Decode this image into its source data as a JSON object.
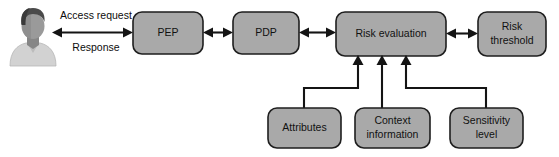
{
  "diagram": {
    "background_color": "#ffffff",
    "node_fill_color": "#a9a9a9",
    "node_border_color": "#1e1e1e",
    "connector_color": "#141414",
    "text_color": "#111111"
  },
  "actor": {
    "name": "user-avatar",
    "icon": "user-person-icon"
  },
  "edge_labels": {
    "access_request": "Access request",
    "response": "Response"
  },
  "nodes": {
    "pep": {
      "label": "PEP",
      "lines": [
        "PEP"
      ]
    },
    "pdp": {
      "label": "PDP",
      "lines": [
        "PDP"
      ]
    },
    "risk_evaluation": {
      "label": "Risk evaluation",
      "lines": [
        "Risk evaluation"
      ]
    },
    "risk_threshold": {
      "label": "Risk threshold",
      "lines": [
        "Risk",
        "threshold"
      ]
    },
    "attributes": {
      "label": "Attributes",
      "lines": [
        "Attributes"
      ]
    },
    "context_information": {
      "label": "Context information",
      "lines": [
        "Context",
        "information"
      ]
    },
    "sensitivity_level": {
      "label": "Sensitivity level",
      "lines": [
        "Sensitivity",
        "level"
      ]
    }
  }
}
